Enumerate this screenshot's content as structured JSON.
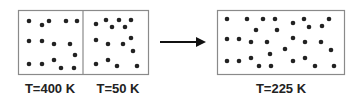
{
  "diagram": {
    "initial_state": {
      "compartments": [
        {
          "label": "T=400 K",
          "temperature_K": 400,
          "particle_count": 15
        },
        {
          "label": "T=50 K",
          "temperature_K": 50,
          "particle_count": 15
        }
      ]
    },
    "transition": {
      "icon": "right-arrow-icon"
    },
    "final_state": {
      "label": "T=225 K",
      "temperature_K": 225,
      "particle_count": 30
    },
    "colors": {
      "particle": "#222222",
      "border": "#8a8a8a",
      "arrow": "#111111",
      "text": "#222222"
    }
  }
}
